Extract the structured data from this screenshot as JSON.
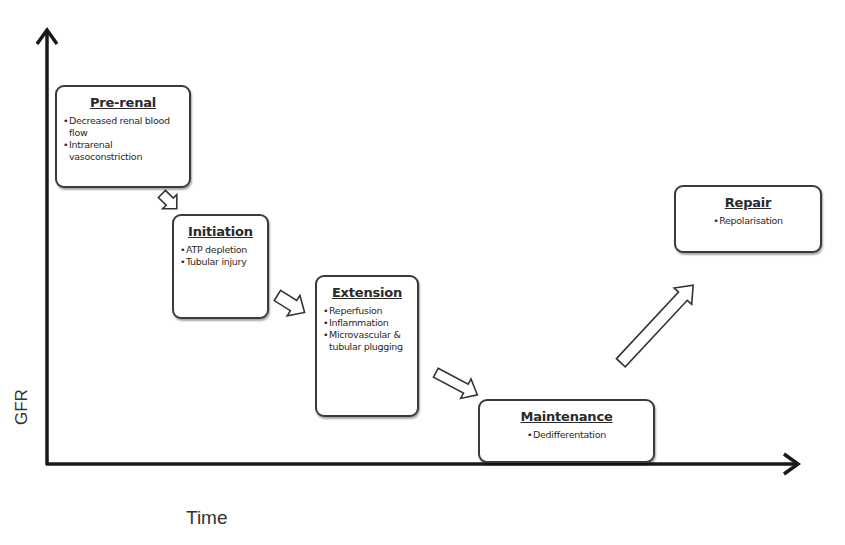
{
  "axes": {
    "x_label": "Time",
    "y_label": "GFR"
  },
  "stages": [
    {
      "title": "Pre-renal",
      "items": [
        "Decreased renal blood flow",
        "Intrarenal vasoconstriction"
      ]
    },
    {
      "title": "Initiation",
      "items": [
        "ATP depletion",
        "Tubular injury"
      ]
    },
    {
      "title": "Extension",
      "items": [
        "Reperfusion",
        "Inflammation",
        "Microvascular & tubular plugging"
      ]
    },
    {
      "title": "Maintenance",
      "items": [
        "Dedifferentation"
      ]
    },
    {
      "title": "Repair",
      "items": [
        "Repolarisation"
      ]
    }
  ],
  "flow": [
    "Pre-renal",
    "Initiation",
    "Extension",
    "Maintenance",
    "Repair"
  ],
  "colors": {
    "axis": "#1a1a1a",
    "box_border": "#3a3a3a",
    "background": "#ffffff"
  }
}
